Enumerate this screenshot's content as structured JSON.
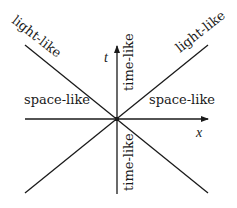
{
  "diagram": {
    "colors": {
      "stroke": "#1a1a1a",
      "background": "#ffffff"
    },
    "axes": {
      "time_label": "t",
      "space_label": "x"
    },
    "regions": {
      "light_like_left": "light-like",
      "light_like_right": "light-like",
      "space_like_left": "space-like",
      "space_like_right": "space-like",
      "time_like_top": "time-like",
      "time_like_bottom": "time-like"
    }
  }
}
